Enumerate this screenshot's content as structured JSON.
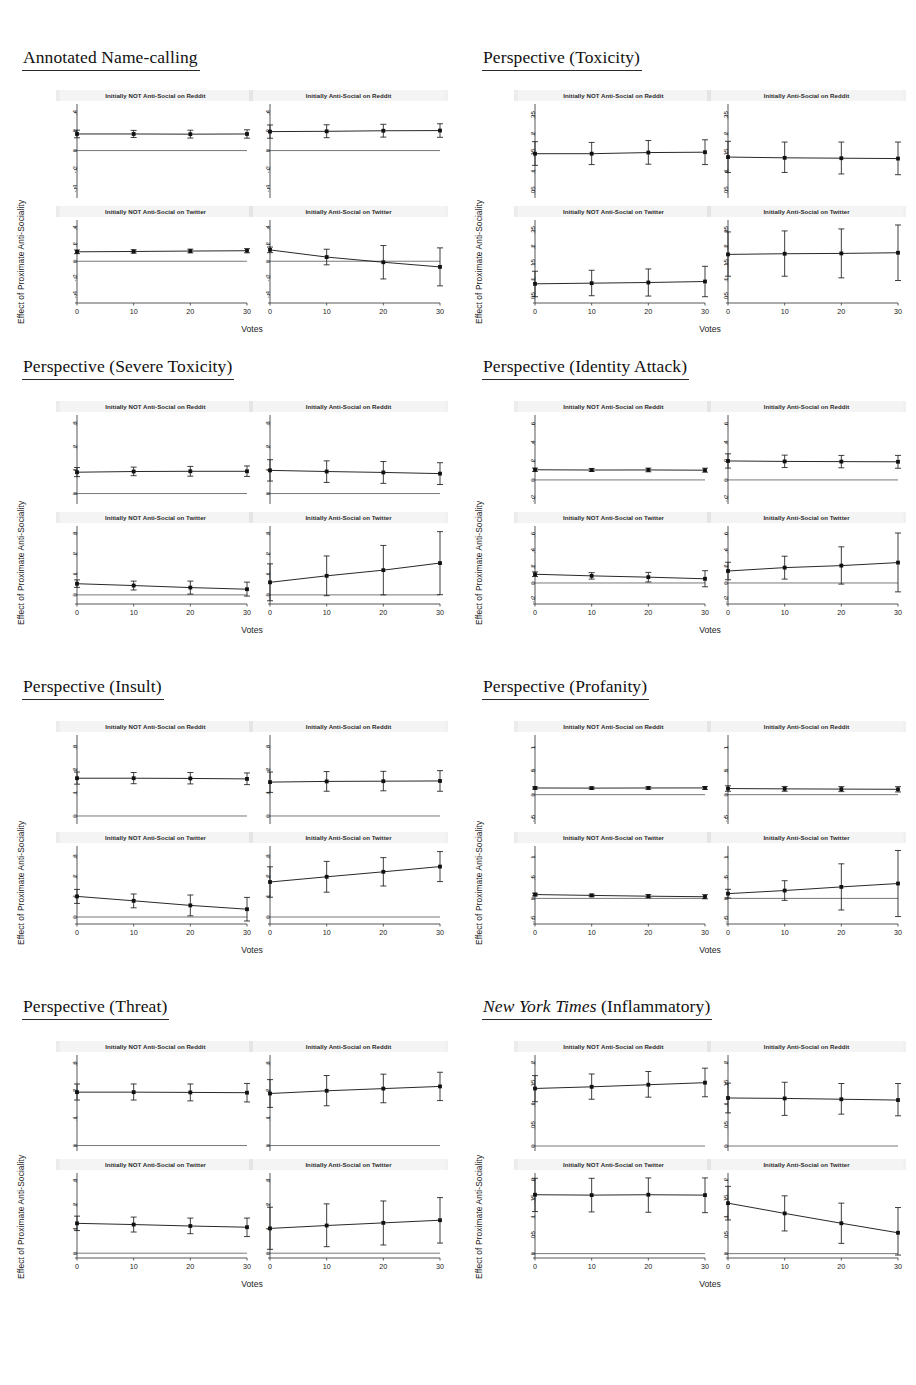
{
  "figure": {
    "shared": {
      "xlabel": "Votes",
      "ylabel": "Effect of Proximate Anti-Sociality",
      "xticks": [
        "0",
        "10",
        "20",
        "30"
      ],
      "xvalues": [
        0,
        10,
        20,
        30
      ],
      "subplot_titles": [
        "Initially NOT Anti-Social on Reddit",
        "Initially Anti-Social on Reddit",
        "Initially NOT Anti-Social on Twitter",
        "Initially Anti-Social on Twitter"
      ]
    }
  },
  "chart_data": [
    {
      "type": "line",
      "title": "Annotated Name-calling",
      "title_style": "plain",
      "xlabel": "Votes",
      "ylabel": "Effect of Proximate Anti-Sociality",
      "x": [
        0,
        10,
        20,
        30
      ],
      "ylim": [
        -0.5,
        0.47
      ],
      "yticks": [
        0.4,
        0.2,
        0,
        -0.2,
        -0.4
      ],
      "ytick_labels": [
        ".4",
        ".2",
        "0",
        "-.2",
        "-.4"
      ],
      "grid": false,
      "legend": "none",
      "subplots": [
        {
          "title": "Initially NOT Anti-Social on Reddit",
          "values": [
            0.175,
            0.175,
            0.173,
            0.175
          ],
          "lower": [
            0.135,
            0.138,
            0.132,
            0.131
          ],
          "upper": [
            0.215,
            0.213,
            0.215,
            0.219
          ]
        },
        {
          "title": "Initially Anti-Social on Reddit",
          "values": [
            0.2,
            0.203,
            0.209,
            0.211
          ],
          "lower": [
            0.13,
            0.136,
            0.142,
            0.14
          ],
          "upper": [
            0.27,
            0.272,
            0.277,
            0.283
          ]
        },
        {
          "title": "Initially NOT Anti-Social on Twitter",
          "values": [
            0.113,
            0.117,
            0.122,
            0.126
          ],
          "lower": [
            0.091,
            0.097,
            0.1,
            0.101
          ],
          "upper": [
            0.135,
            0.138,
            0.145,
            0.151
          ]
        },
        {
          "title": "Initially Anti-Social on Twitter",
          "values": [
            0.136,
            0.05,
            -0.012,
            -0.068
          ],
          "lower": [
            0.103,
            -0.043,
            -0.212,
            -0.295
          ],
          "upper": [
            0.17,
            0.144,
            0.188,
            0.16
          ]
        }
      ]
    },
    {
      "type": "line",
      "title": "Perspective (Toxicity)",
      "title_style": "plain",
      "xlabel": "Votes",
      "ylabel": "Effect of Proximate Anti-Sociality",
      "x": [
        0,
        10,
        20,
        30
      ],
      "ylim": [
        0.03,
        0.275
      ],
      "yticks": [
        0.25,
        0.2,
        0.15,
        0.1,
        0.05
      ],
      "ytick_labels": [
        ".25",
        ".2",
        ".15",
        ".1",
        ".05"
      ],
      "grid": false,
      "legend": "none",
      "subplots": [
        {
          "title": "Initially NOT Anti-Social on Reddit",
          "values": [
            0.148,
            0.148,
            0.151,
            0.152
          ],
          "lower": [
            0.117,
            0.119,
            0.12,
            0.119
          ],
          "upper": [
            0.18,
            0.178,
            0.183,
            0.185
          ]
        },
        {
          "title": "Initially Anti-Social on Reddit",
          "values": [
            0.139,
            0.137,
            0.136,
            0.135
          ],
          "lower": [
            0.098,
            0.098,
            0.094,
            0.092
          ],
          "upper": [
            0.181,
            0.179,
            0.179,
            0.179
          ]
        },
        {
          "title": "Initially NOT Anti-Social on Twitter",
          "values": [
            0.088,
            0.09,
            0.092,
            0.095
          ],
          "lower": [
            0.049,
            0.052,
            0.051,
            0.049
          ],
          "upper": [
            0.126,
            0.129,
            0.133,
            0.141
          ]
        },
        {
          "title": "Initially Anti-Social on Twitter",
          "values": [
            0.177,
            0.179,
            0.18,
            0.182
          ],
          "lower": [
            0.111,
            0.111,
            0.106,
            0.098
          ],
          "upper": [
            0.245,
            0.248,
            0.254,
            0.266
          ]
        }
      ]
    },
    {
      "type": "line",
      "title": "Perspective (Severe Toxicity)",
      "title_style": "plain",
      "xlabel": "Votes",
      "ylabel": "Effect of Proximate Anti-Sociality",
      "x": [
        0,
        10,
        20,
        30
      ],
      "ylim": [
        -0.045,
        0.33
      ],
      "yticks": [
        0.3,
        0.2,
        0.1,
        0
      ],
      "ytick_labels": [
        ".3",
        ".2",
        ".1",
        "0"
      ],
      "grid": false,
      "legend": "none",
      "subplots": [
        {
          "title": "Initially NOT Anti-Social on Reddit",
          "values": [
            0.092,
            0.095,
            0.096,
            0.096
          ],
          "lower": [
            0.073,
            0.077,
            0.075,
            0.074
          ],
          "upper": [
            0.112,
            0.114,
            0.117,
            0.119
          ]
        },
        {
          "title": "Initially Anti-Social on Reddit",
          "values": [
            0.1,
            0.095,
            0.091,
            0.086
          ],
          "lower": [
            0.054,
            0.048,
            0.044,
            0.039
          ],
          "upper": [
            0.146,
            0.141,
            0.138,
            0.133
          ]
        },
        {
          "title": "Initially NOT Anti-Social on Twitter",
          "values": [
            0.055,
            0.046,
            0.036,
            0.028
          ],
          "lower": [
            0.037,
            0.024,
            0.004,
            -0.006
          ],
          "upper": [
            0.074,
            0.068,
            0.068,
            0.063
          ]
        },
        {
          "title": "Initially Anti-Social on Twitter",
          "values": [
            0.062,
            0.094,
            0.122,
            0.157
          ],
          "lower": [
            -0.029,
            -0.004,
            0.0,
            0.001
          ],
          "upper": [
            0.153,
            0.192,
            0.244,
            0.312
          ]
        }
      ]
    },
    {
      "type": "line",
      "title": "Perspective (Identity Attack)",
      "title_style": "plain",
      "xlabel": "Votes",
      "ylabel": "Effect of Proximate Anti-Sociality",
      "x": [
        0,
        10,
        20,
        30
      ],
      "ylim": [
        -0.26,
        0.68
      ],
      "yticks": [
        0.6,
        0.4,
        0.2,
        0,
        -0.2
      ],
      "ytick_labels": [
        ".6",
        ".4",
        ".2",
        "0",
        "-.2"
      ],
      "grid": false,
      "legend": "none",
      "subplots": [
        {
          "title": "Initially NOT Anti-Social on Reddit",
          "values": [
            0.11,
            0.107,
            0.108,
            0.105
          ],
          "lower": [
            0.092,
            0.091,
            0.088,
            0.084
          ],
          "upper": [
            0.128,
            0.124,
            0.128,
            0.127
          ]
        },
        {
          "title": "Initially Anti-Social on Reddit",
          "values": [
            0.205,
            0.2,
            0.198,
            0.196
          ],
          "lower": [
            0.128,
            0.134,
            0.131,
            0.126
          ],
          "upper": [
            0.282,
            0.268,
            0.265,
            0.265
          ]
        },
        {
          "title": "Initially NOT Anti-Social on Twitter",
          "values": [
            0.108,
            0.088,
            0.072,
            0.052
          ],
          "lower": [
            0.08,
            0.048,
            0.013,
            -0.047
          ],
          "upper": [
            0.137,
            0.128,
            0.131,
            0.152
          ]
        },
        {
          "title": "Initially Anti-Social on Twitter",
          "values": [
            0.148,
            0.19,
            0.215,
            0.252
          ],
          "lower": [
            0.04,
            0.048,
            -0.014,
            -0.11
          ],
          "upper": [
            0.256,
            0.331,
            0.447,
            0.618
          ]
        }
      ]
    },
    {
      "type": "line",
      "title": "Perspective (Insult)",
      "title_style": "plain",
      "xlabel": "Votes",
      "ylabel": "Effect of Proximate Anti-Sociality",
      "x": [
        0,
        10,
        20,
        30
      ],
      "ylim": [
        -0.035,
        0.345
      ],
      "yticks": [
        0.3,
        0.2,
        0.1,
        0
      ],
      "ytick_labels": [
        ".3",
        ".2",
        ".1",
        "0"
      ],
      "grid": false,
      "legend": "none",
      "subplots": [
        {
          "title": "Initially NOT Anti-Social on Reddit",
          "values": [
            0.165,
            0.165,
            0.164,
            0.162
          ],
          "lower": [
            0.139,
            0.141,
            0.14,
            0.137
          ],
          "upper": [
            0.192,
            0.19,
            0.19,
            0.188
          ]
        },
        {
          "title": "Initially Anti-Social on Reddit",
          "values": [
            0.148,
            0.151,
            0.152,
            0.153
          ],
          "lower": [
            0.103,
            0.108,
            0.11,
            0.108
          ],
          "upper": [
            0.192,
            0.194,
            0.195,
            0.198
          ]
        },
        {
          "title": "Initially NOT Anti-Social on Twitter",
          "values": [
            0.103,
            0.081,
            0.058,
            0.039
          ],
          "lower": [
            0.068,
            0.046,
            0.006,
            -0.02
          ],
          "upper": [
            0.138,
            0.115,
            0.11,
            0.098
          ]
        },
        {
          "title": "Initially Anti-Social on Twitter",
          "values": [
            0.175,
            0.201,
            0.226,
            0.252
          ],
          "lower": [
            0.099,
            0.124,
            0.155,
            0.177
          ],
          "upper": [
            0.251,
            0.278,
            0.297,
            0.327
          ]
        }
      ]
    },
    {
      "type": "line",
      "title": "Perspective (Profanity)",
      "title_style": "plain",
      "xlabel": "Votes",
      "ylabel": "Effect of Proximate Anti-Sociality",
      "x": [
        0,
        10,
        20,
        30
      ],
      "ylim": [
        -0.62,
        1.22
      ],
      "yticks": [
        1,
        0.5,
        0,
        -0.5
      ],
      "ytick_labels": [
        "1",
        ".5",
        "0",
        "-.5"
      ],
      "grid": false,
      "legend": "none",
      "subplots": [
        {
          "title": "Initially NOT Anti-Social on Reddit",
          "values": [
            0.142,
            0.139,
            0.142,
            0.143
          ],
          "lower": [
            0.118,
            0.116,
            0.116,
            0.114
          ],
          "upper": [
            0.166,
            0.162,
            0.168,
            0.172
          ]
        },
        {
          "title": "Initially Anti-Social on Reddit",
          "values": [
            0.13,
            0.123,
            0.118,
            0.114
          ],
          "lower": [
            0.072,
            0.072,
            0.065,
            0.058
          ],
          "upper": [
            0.188,
            0.174,
            0.171,
            0.17
          ]
        },
        {
          "title": "Initially NOT Anti-Social on Twitter",
          "values": [
            0.093,
            0.072,
            0.053,
            0.04
          ],
          "lower": [
            0.06,
            0.041,
            0.014,
            -0.01
          ],
          "upper": [
            0.126,
            0.103,
            0.092,
            0.09
          ]
        },
        {
          "title": "Initially Anti-Social on Twitter",
          "values": [
            0.115,
            0.19,
            0.278,
            0.36
          ],
          "lower": [
            0.01,
            -0.048,
            -0.281,
            -0.44
          ],
          "upper": [
            0.22,
            0.428,
            0.837,
            1.16
          ]
        }
      ]
    },
    {
      "type": "line",
      "title": "Perspective (Threat)",
      "title_style": "plain",
      "xlabel": "Votes",
      "ylabel": "Effect of Proximate Anti-Sociality",
      "x": [
        0,
        10,
        20,
        30
      ],
      "ylim": [
        -0.02,
        0.325
      ],
      "yticks": [
        0.3,
        0.2,
        0.1,
        0
      ],
      "ytick_labels": [
        ".3",
        ".2",
        ".1",
        "0"
      ],
      "grid": false,
      "legend": "none",
      "subplots": [
        {
          "title": "Initially NOT Anti-Social on Reddit",
          "values": [
            0.196,
            0.196,
            0.195,
            0.194
          ],
          "lower": [
            0.167,
            0.167,
            0.164,
            0.16
          ],
          "upper": [
            0.226,
            0.226,
            0.226,
            0.228
          ]
        },
        {
          "title": "Initially Anti-Social on Reddit",
          "values": [
            0.191,
            0.201,
            0.209,
            0.217
          ],
          "lower": [
            0.14,
            0.146,
            0.157,
            0.165
          ],
          "upper": [
            0.242,
            0.257,
            0.262,
            0.269
          ]
        },
        {
          "title": "Initially NOT Anti-Social on Twitter",
          "values": [
            0.124,
            0.119,
            0.113,
            0.108
          ],
          "lower": [
            0.094,
            0.088,
            0.081,
            0.069
          ],
          "upper": [
            0.154,
            0.15,
            0.146,
            0.146
          ]
        },
        {
          "title": "Initially Anti-Social on Twitter",
          "values": [
            0.103,
            0.115,
            0.126,
            0.137
          ],
          "lower": [
            0.016,
            0.027,
            0.034,
            0.042
          ],
          "upper": [
            0.191,
            0.205,
            0.217,
            0.231
          ]
        }
      ]
    },
    {
      "type": "line",
      "title": "New York Times (Inflammatory)",
      "title_style": "italic-prefix",
      "title_italic_part": "New York Times",
      "title_rest": " (Inflammatory)",
      "xlabel": "Votes",
      "ylabel": "Effect of Proximate Anti-Sociality",
      "x": [
        0,
        10,
        20,
        30
      ],
      "ylim": [
        -0.012,
        0.215
      ],
      "yticks": [
        0.2,
        0.15,
        0.1,
        0.05,
        0
      ],
      "ytick_labels": [
        ".2",
        ".15",
        ".1",
        ".05",
        "0"
      ],
      "grid": false,
      "legend": "none",
      "subplots": [
        {
          "title": "Initially NOT Anti-Social on Reddit",
          "values": [
            0.139,
            0.143,
            0.148,
            0.153
          ],
          "lower": [
            0.107,
            0.113,
            0.118,
            0.119
          ],
          "upper": [
            0.17,
            0.174,
            0.18,
            0.188
          ]
        },
        {
          "title": "Initially Anti-Social on Reddit",
          "values": [
            0.116,
            0.115,
            0.113,
            0.111
          ],
          "lower": [
            0.08,
            0.074,
            0.077,
            0.073
          ],
          "upper": [
            0.152,
            0.154,
            0.151,
            0.151
          ]
        },
        {
          "title": "Initially NOT Anti-Social on Twitter",
          "values": [
            0.161,
            0.16,
            0.161,
            0.16
          ],
          "lower": [
            0.115,
            0.114,
            0.113,
            0.112
          ],
          "upper": [
            0.206,
            0.206,
            0.207,
            0.207
          ]
        },
        {
          "title": "Initially Anti-Social on Twitter",
          "values": [
            0.138,
            0.11,
            0.083,
            0.057
          ],
          "lower": [
            0.092,
            0.062,
            0.028,
            -0.004
          ],
          "upper": [
            0.184,
            0.158,
            0.138,
            0.126
          ]
        }
      ]
    }
  ]
}
